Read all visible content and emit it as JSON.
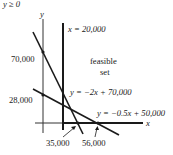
{
  "header_fragment": "y ≥ 0",
  "axes": {
    "x_label": "x",
    "y_label": "y"
  },
  "region": {
    "line1": "feasible",
    "line2": "set"
  },
  "constraints": [
    {
      "id": "vertical",
      "label": "x = 20,000"
    },
    {
      "id": "steep",
      "label": "y = −2x + 70,000"
    },
    {
      "id": "shallow",
      "label": "y = −0.5x + 50,000"
    }
  ],
  "intercepts": {
    "y_axis": [
      "70,000",
      "28,000"
    ],
    "x_axis": [
      "35,000",
      "56,000"
    ]
  },
  "colors": {
    "ink": "#1a1a1a",
    "axis": "#333333",
    "background": "#ffffff"
  }
}
